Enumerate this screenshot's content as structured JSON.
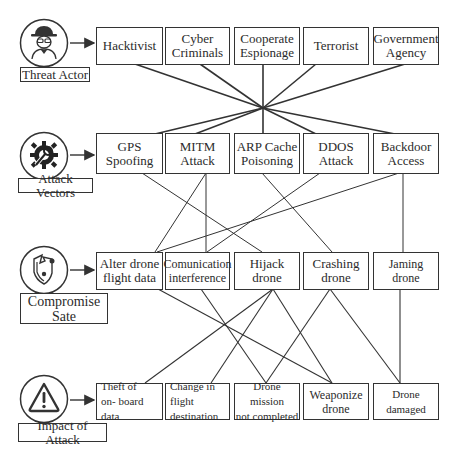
{
  "rows": [
    {
      "category": "Threat Actor",
      "icon": "spy-icon",
      "items": [
        "Hacktivist",
        "Cyber\nCriminals",
        "Cooperate\nEspionage",
        "Terrorist",
        "Government\nAgency"
      ]
    },
    {
      "category": "Attack Vectors",
      "icon": "gear-wrench-icon",
      "items": [
        "GPS\nSpoofing",
        "MITM\nAttack",
        "ARP Cache\nPoisoning",
        "DDOS\nAttack",
        "Backdoor\nAccess"
      ]
    },
    {
      "category": "Compromise\nSate",
      "icon": "broken-shield-icon",
      "items": [
        "Alter drone\nflight data",
        "Comunication\ninterference",
        "Hijack drone",
        "Crashing\ndrone",
        "Jaming drone"
      ]
    },
    {
      "category": "Impact of Attack",
      "icon": "warning-icon",
      "items": [
        "Theft of\non- board data",
        "Change in flight\ndestination",
        "Drone mission\nnot completed",
        "Weaponize\ndrone",
        "Drone damaged"
      ]
    }
  ],
  "connections": {
    "threat_to_vectors": "all converge at single hub point",
    "vectors_to_compromise": [
      [
        "GPS Spoofing",
        "Hijack drone"
      ],
      [
        "MITM Attack",
        "Alter drone flight data"
      ],
      [
        "MITM Attack",
        "Comunication interference"
      ],
      [
        "ARP Cache Poisoning",
        "Crashing drone"
      ],
      [
        "DDOS Attack",
        "Comunication interference"
      ],
      [
        "Backdoor Access",
        "Alter drone flight data"
      ],
      [
        "Backdoor Access",
        "Jaming drone"
      ]
    ],
    "compromise_to_impact": [
      [
        "Alter drone flight data",
        "Weaponize drone"
      ],
      [
        "Comunication interference",
        "Drone mission not completed"
      ],
      [
        "Hijack drone",
        "Theft of on- board data"
      ],
      [
        "Hijack drone",
        "Change in flight destination"
      ],
      [
        "Hijack drone",
        "Weaponize drone"
      ],
      [
        "Crashing drone",
        "Drone mission not completed"
      ],
      [
        "Crashing drone",
        "Drone damaged"
      ],
      [
        "Jaming drone",
        "Drone damaged"
      ]
    ]
  },
  "colors": {
    "stroke": "#333333",
    "background": "#ffffff"
  }
}
